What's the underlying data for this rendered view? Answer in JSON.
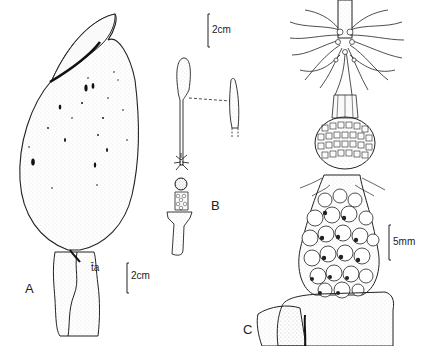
{
  "figure": {
    "panels": [
      {
        "id": "A",
        "label": "A",
        "subject": "spathe-with-peduncle"
      },
      {
        "id": "B",
        "label": "B",
        "subject": "spadix-with-appendix-detail"
      },
      {
        "id": "C",
        "label": "C",
        "subject": "spadix-flowers-detail"
      }
    ],
    "annotations": {
      "panel_a_stalk_mark": "t̄a"
    },
    "scale_bars": [
      {
        "panel": "A",
        "label": "2cm"
      },
      {
        "panel": "B",
        "label": "2cm"
      },
      {
        "panel": "C",
        "label": "5mm"
      }
    ]
  }
}
